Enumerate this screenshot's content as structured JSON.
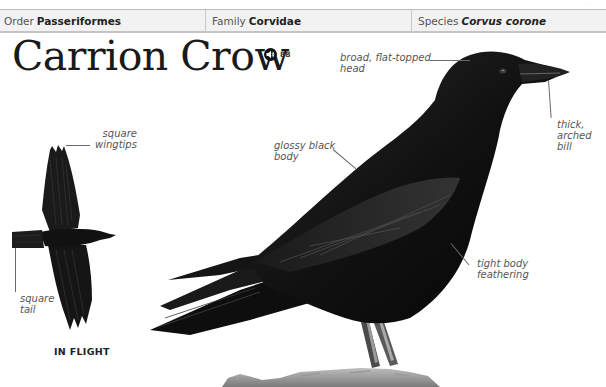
{
  "taxonomy": {
    "order": {
      "label": "Order",
      "value": "Passeriformes"
    },
    "family": {
      "label": "Family",
      "value": "Corvidae"
    },
    "species": {
      "label": "Species",
      "value": "Corvus corone"
    }
  },
  "title": "Carrion Crow",
  "audio": {
    "icon": "speaker-icon",
    "ref": "88"
  },
  "annotations": {
    "head": {
      "line1": "broad, flat-topped",
      "line2": "head"
    },
    "bill": {
      "line1": "thick,",
      "line2": "arched",
      "line3": "bill"
    },
    "body": {
      "line1": "glossy black",
      "line2": "body"
    },
    "feathering": {
      "line1": "tight body",
      "line2": "feathering"
    },
    "wingtips": {
      "line1": "square",
      "line2": "wingtips"
    },
    "tail": {
      "line1": "square",
      "line2": "tail"
    }
  },
  "in_flight_label": "IN FLIGHT",
  "colors": {
    "header_bg": "#f2f2f2",
    "plumage": "#0d0d0d",
    "annotation": "#555555"
  }
}
